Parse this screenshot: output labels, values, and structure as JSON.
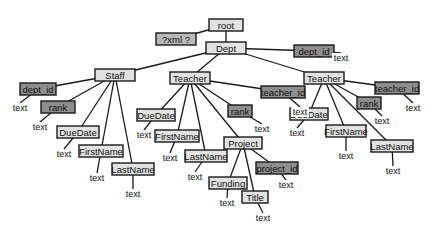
{
  "diagram": {
    "colors": {
      "element": "#e2e2e2",
      "attribute": "#8e8e8e",
      "declaration": "#b8b8b8",
      "line": "#1a1a1a"
    },
    "nodes": [
      {
        "id": "root",
        "label": "root",
        "kind": "element",
        "x": 226,
        "y": 25,
        "w": 34
      },
      {
        "id": "xmldecl",
        "label": "?xml ?",
        "kind": "decl",
        "x": 176,
        "y": 39,
        "w": 40
      },
      {
        "id": "dept",
        "label": "Dept",
        "kind": "element",
        "x": 226,
        "y": 48,
        "w": 40
      },
      {
        "id": "dept_id_a",
        "label": "dept_id",
        "kind": "attribute",
        "x": 314,
        "y": 51,
        "w": 40
      },
      {
        "id": "staff",
        "label": "Staff",
        "kind": "element",
        "x": 115,
        "y": 75,
        "w": 40
      },
      {
        "id": "s_dept_id",
        "label": "dept_id",
        "kind": "attribute",
        "x": 38,
        "y": 89,
        "w": 36
      },
      {
        "id": "s_rank",
        "label": "rank",
        "kind": "attribute",
        "x": 58,
        "y": 107,
        "w": 34
      },
      {
        "id": "s_duedate",
        "label": "DueDate",
        "kind": "element",
        "x": 78,
        "y": 132,
        "w": 42
      },
      {
        "id": "s_firstname",
        "label": "FirstName",
        "kind": "element",
        "x": 101,
        "y": 151,
        "w": 44
      },
      {
        "id": "s_lastname",
        "label": "LastName",
        "kind": "element",
        "x": 133,
        "y": 169,
        "w": 42
      },
      {
        "id": "t1",
        "label": "Teacher",
        "kind": "element",
        "x": 190,
        "y": 78,
        "w": 40
      },
      {
        "id": "t1_teacher_id",
        "label": "teacher_id",
        "kind": "attribute",
        "x": 283,
        "y": 92,
        "w": 44
      },
      {
        "id": "t1_rank",
        "label": "rank",
        "kind": "attribute",
        "x": 240,
        "y": 111,
        "w": 24
      },
      {
        "id": "t1_duedate",
        "label": "DueDate",
        "kind": "element",
        "x": 156,
        "y": 115,
        "w": 38
      },
      {
        "id": "t1_firstname",
        "label": "FirstName",
        "kind": "element",
        "x": 177,
        "y": 136,
        "w": 44
      },
      {
        "id": "t1_lastname",
        "label": "LastName",
        "kind": "element",
        "x": 206,
        "y": 156,
        "w": 42
      },
      {
        "id": "t1_project",
        "label": "Project",
        "kind": "element",
        "x": 243,
        "y": 143,
        "w": 38
      },
      {
        "id": "t1_funding",
        "label": "Funding",
        "kind": "element",
        "x": 228,
        "y": 183,
        "w": 38
      },
      {
        "id": "t1_title",
        "label": "Title",
        "kind": "element",
        "x": 255,
        "y": 197,
        "w": 26
      },
      {
        "id": "t1_project_id",
        "label": "project_id",
        "kind": "attribute",
        "x": 277,
        "y": 168,
        "w": 42
      },
      {
        "id": "t2",
        "label": "Teacher",
        "kind": "element",
        "x": 324,
        "y": 78,
        "w": 40
      },
      {
        "id": "t2_teacher_id",
        "label": "teacher_id",
        "kind": "attribute",
        "x": 397,
        "y": 88,
        "w": 44
      },
      {
        "id": "t2_rank",
        "label": "rank",
        "kind": "attribute",
        "x": 369,
        "y": 103,
        "w": 24
      },
      {
        "id": "t2_duedate",
        "label": "DueDate",
        "kind": "element",
        "x": 309,
        "y": 114,
        "w": 38
      },
      {
        "id": "t2_firstname",
        "label": "FirstName",
        "kind": "element",
        "x": 346,
        "y": 131,
        "w": 40
      },
      {
        "id": "t2_lastname",
        "label": "LastName",
        "kind": "element",
        "x": 392,
        "y": 146,
        "w": 42
      }
    ],
    "edges": [
      [
        "root",
        "xmldecl"
      ],
      [
        "root",
        "dept"
      ],
      [
        "dept",
        "dept_id_a"
      ],
      [
        "dept",
        "staff"
      ],
      [
        "dept",
        "t1"
      ],
      [
        "dept",
        "t2"
      ],
      [
        "staff",
        "s_dept_id"
      ],
      [
        "staff",
        "s_rank"
      ],
      [
        "staff",
        "s_duedate"
      ],
      [
        "staff",
        "s_firstname"
      ],
      [
        "staff",
        "s_lastname"
      ],
      [
        "t1",
        "t1_teacher_id"
      ],
      [
        "t1",
        "t1_rank"
      ],
      [
        "t1",
        "t1_duedate"
      ],
      [
        "t1",
        "t1_firstname"
      ],
      [
        "t1",
        "t1_lastname"
      ],
      [
        "t1",
        "t1_project"
      ],
      [
        "t1_project",
        "t1_funding"
      ],
      [
        "t1_project",
        "t1_title"
      ],
      [
        "t1_project",
        "t1_project_id"
      ],
      [
        "t2",
        "t2_teacher_id"
      ],
      [
        "t2",
        "t2_rank"
      ],
      [
        "t2",
        "t2_duedate"
      ],
      [
        "t2",
        "t2_firstname"
      ],
      [
        "t2",
        "t2_lastname"
      ]
    ],
    "text_leaves": [
      {
        "parent": "dept_id_a",
        "label": "text",
        "x": 341,
        "y": 58
      },
      {
        "parent": "s_dept_id",
        "label": "text",
        "x": 20,
        "y": 108
      },
      {
        "parent": "s_rank",
        "label": "text",
        "x": 40,
        "y": 127
      },
      {
        "parent": "s_duedate",
        "label": "text",
        "x": 64,
        "y": 154
      },
      {
        "parent": "s_firstname",
        "label": "text",
        "x": 97,
        "y": 178
      },
      {
        "parent": "s_lastname",
        "label": "text",
        "x": 133,
        "y": 194
      },
      {
        "parent": "t1_teacher_id",
        "label": "text",
        "x": 300,
        "y": 112
      },
      {
        "parent": "t1_rank",
        "label": "text",
        "x": 262,
        "y": 129
      },
      {
        "parent": "t1_duedate",
        "label": "text",
        "x": 144,
        "y": 135
      },
      {
        "parent": "t1_firstname",
        "label": "text",
        "x": 170,
        "y": 158
      },
      {
        "parent": "t1_lastname",
        "label": "text",
        "x": 195,
        "y": 177
      },
      {
        "parent": "t1_funding",
        "label": "text",
        "x": 227,
        "y": 203
      },
      {
        "parent": "t1_title",
        "label": "text",
        "x": 263,
        "y": 218
      },
      {
        "parent": "t1_project_id",
        "label": "text",
        "x": 286,
        "y": 185
      },
      {
        "parent": "t2_teacher_id",
        "label": "text",
        "x": 413,
        "y": 108
      },
      {
        "parent": "t2_rank",
        "label": "text",
        "x": 382,
        "y": 121
      },
      {
        "parent": "t2_duedate",
        "label": "text",
        "x": 297,
        "y": 133
      },
      {
        "parent": "t2_firstname",
        "label": "text",
        "x": 346,
        "y": 156
      },
      {
        "parent": "t2_lastname",
        "label": "text",
        "x": 393,
        "y": 171
      }
    ]
  }
}
